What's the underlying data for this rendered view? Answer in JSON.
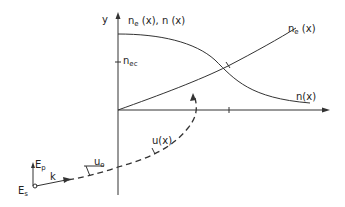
{
  "diagram": {
    "type": "physics-sketch",
    "y_axis_label": "y",
    "header_label": {
      "main": "n",
      "sub": "e",
      "rest": " (x), n (x)"
    },
    "n_ec_label": {
      "main": "n",
      "sub": "ec"
    },
    "curve_ne_label": {
      "main": "n",
      "sub": "e",
      "rest": " (x)"
    },
    "curve_n_label": "n(x)",
    "ux_label": "u(x)",
    "u0_label": {
      "main": "u",
      "sub": "o"
    },
    "ep_label": {
      "main": "E",
      "sub": "p"
    },
    "es_label": {
      "main": "E",
      "sub": "s"
    },
    "k_label": "k",
    "colors": {
      "line": "#333333",
      "background": "#ffffff"
    }
  }
}
